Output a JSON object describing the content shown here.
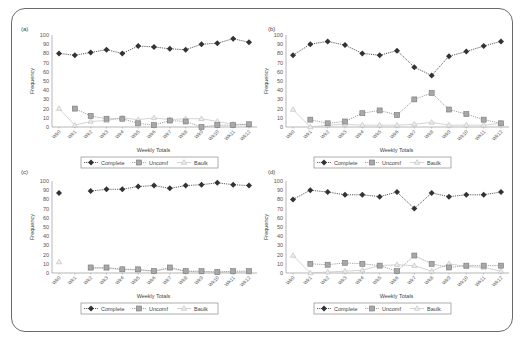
{
  "colors": {
    "complete": "#333333",
    "uncomf": "#8c8c8c",
    "baulk": "#c8c8c8",
    "axis": "#888888",
    "frame": "#6a6a6a"
  },
  "chart_data": [
    {
      "panel": "(a)",
      "type": "line",
      "title": "",
      "xlabel": "Weekly Totals",
      "ylabel": "Frequency",
      "ylim": [
        0,
        100
      ],
      "yticks": [
        0,
        10,
        20,
        30,
        40,
        50,
        60,
        70,
        80,
        90,
        100
      ],
      "categories": [
        "Wk0",
        "Wk1",
        "Wk2",
        "Wk3",
        "Wk4",
        "Wk5",
        "Wk6",
        "Wk7",
        "Wk8",
        "Wk9",
        "Wk10",
        "Wk11",
        "Wk12"
      ],
      "legend_position": "bottom",
      "grid": false,
      "series": [
        {
          "name": "Complete",
          "marker": "diamond",
          "values": [
            80,
            78,
            81,
            84,
            80,
            88,
            87,
            85,
            84,
            90,
            91,
            96,
            92
          ]
        },
        {
          "name": "Uncomf",
          "marker": "square",
          "values": [
            null,
            20,
            12,
            9,
            9,
            4,
            2,
            7,
            6,
            0,
            2,
            2,
            3
          ]
        },
        {
          "name": "Baulk",
          "marker": "triangle",
          "values": [
            20,
            2,
            6,
            7,
            10,
            8,
            10,
            8,
            9,
            9,
            6,
            3,
            2
          ]
        }
      ]
    },
    {
      "panel": "(b)",
      "type": "line",
      "title": "",
      "xlabel": "Weekly Totals",
      "ylabel": "Frequency",
      "ylim": [
        0,
        100
      ],
      "yticks": [
        0,
        10,
        20,
        30,
        40,
        50,
        60,
        70,
        80,
        90,
        100
      ],
      "categories": [
        "Wk0",
        "Wk1",
        "Wk2",
        "Wk3",
        "Wk4",
        "Wk5",
        "Wk6",
        "Wk7",
        "Wk8",
        "Wk9",
        "Wk10",
        "Wk11",
        "Wk12"
      ],
      "legend_position": "bottom",
      "grid": false,
      "series": [
        {
          "name": "Complete",
          "marker": "diamond",
          "values": [
            78,
            90,
            93,
            89,
            80,
            78,
            83,
            65,
            56,
            77,
            82,
            88,
            93
          ]
        },
        {
          "name": "Uncomf",
          "marker": "square",
          "values": [
            null,
            8,
            4,
            6,
            15,
            18,
            13,
            30,
            37,
            19,
            14,
            8,
            4
          ]
        },
        {
          "name": "Baulk",
          "marker": "triangle",
          "values": [
            19,
            0,
            2,
            3,
            2,
            2,
            2,
            3,
            5,
            2,
            2,
            2,
            4
          ]
        }
      ]
    },
    {
      "panel": "(c)",
      "type": "line",
      "title": "",
      "xlabel": "Weekly Totals",
      "ylabel": "Frequency",
      "ylim": [
        0,
        100
      ],
      "yticks": [
        0,
        10,
        20,
        30,
        40,
        50,
        60,
        70,
        80,
        90,
        100
      ],
      "categories": [
        "Wk0",
        "Wk1",
        "Wk2",
        "Wk3",
        "Wk4",
        "Wk5",
        "Wk6",
        "Wk7",
        "Wk8",
        "Wk9",
        "Wk10",
        "Wk11",
        "Wk12"
      ],
      "legend_position": "bottom",
      "grid": false,
      "series": [
        {
          "name": "Complete",
          "marker": "diamond",
          "values": [
            87,
            null,
            89,
            91,
            91,
            94,
            95,
            92,
            95,
            96,
            98,
            96,
            95
          ]
        },
        {
          "name": "Uncomf",
          "marker": "square",
          "values": [
            null,
            null,
            6,
            6,
            4,
            4,
            2,
            6,
            2,
            2,
            1,
            2,
            2
          ]
        },
        {
          "name": "Baulk",
          "marker": "triangle",
          "values": [
            12,
            null,
            5,
            5,
            4,
            3,
            2,
            5,
            2,
            1,
            1,
            1,
            1
          ]
        }
      ]
    },
    {
      "panel": "(d)",
      "type": "line",
      "title": "",
      "xlabel": "Weekly Totals",
      "ylabel": "Frequency",
      "ylim": [
        0,
        100
      ],
      "yticks": [
        0,
        10,
        20,
        30,
        40,
        50,
        60,
        70,
        80,
        90,
        100
      ],
      "categories": [
        "Wk0",
        "Wk1",
        "Wk2",
        "Wk3",
        "Wk4",
        "Wk5",
        "Wk6",
        "Wk7",
        "Wk8",
        "Wk9",
        "Wk10",
        "Wk11",
        "Wk12"
      ],
      "legend_position": "bottom",
      "grid": false,
      "series": [
        {
          "name": "Complete",
          "marker": "diamond",
          "values": [
            80,
            90,
            88,
            85,
            85,
            83,
            88,
            70,
            87,
            83,
            85,
            85,
            88
          ]
        },
        {
          "name": "Uncomf",
          "marker": "square",
          "values": [
            null,
            10,
            9,
            11,
            10,
            8,
            2,
            19,
            10,
            6,
            8,
            8,
            8
          ]
        },
        {
          "name": "Baulk",
          "marker": "triangle",
          "values": [
            19,
            0,
            1,
            2,
            3,
            8,
            9,
            8,
            2,
            10,
            7,
            6,
            2
          ]
        }
      ]
    }
  ],
  "panels": [
    {
      "label": "(a)",
      "x": 0,
      "y": 0
    },
    {
      "label": "(b)",
      "x": 262,
      "y": 0
    },
    {
      "label": "(c)",
      "x": 0,
      "y": 170
    },
    {
      "label": "(d)",
      "x": 262,
      "y": 170
    }
  ],
  "legend": {
    "items": [
      "Complete",
      "Uncomf",
      "Baulk"
    ]
  }
}
